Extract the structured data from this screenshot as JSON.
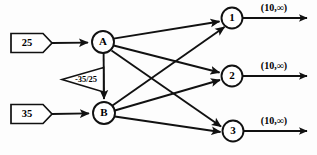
{
  "diagram": {
    "type": "network-flow-graph",
    "title": "",
    "canvas": {
      "width": 317,
      "height": 155
    },
    "supply_nodes": [
      {
        "id": "supply-25",
        "label": "25",
        "shape": "pentagon-right",
        "x": 30,
        "y": 43
      },
      {
        "id": "supply-35",
        "label": "35",
        "shape": "pentagon-right",
        "x": 30,
        "y": 114
      }
    ],
    "transshipment_nodes": [
      {
        "id": "node-a",
        "label": "A",
        "shape": "circle",
        "x": 103,
        "y": 42,
        "r": 11
      },
      {
        "id": "node-b",
        "label": "B",
        "shape": "circle",
        "x": 104,
        "y": 113,
        "r": 11
      }
    ],
    "demand_nodes": [
      {
        "id": "node-1",
        "label": "1",
        "shape": "circle",
        "x": 232,
        "y": 18,
        "r": 10.5
      },
      {
        "id": "node-2",
        "label": "2",
        "shape": "circle",
        "x": 232,
        "y": 76,
        "r": 10.5
      },
      {
        "id": "node-3",
        "label": "3",
        "shape": "circle",
        "x": 233,
        "y": 131,
        "r": 10.5
      }
    ],
    "edges": [
      {
        "id": "edge-supply25-a",
        "from": "supply-25",
        "to": "node-a",
        "label": ""
      },
      {
        "id": "edge-supply35-b",
        "from": "supply-35",
        "to": "node-b",
        "label": ""
      },
      {
        "id": "edge-a-b",
        "from": "node-a",
        "to": "node-b",
        "label": "-35/25"
      },
      {
        "id": "edge-a-1",
        "from": "node-a",
        "to": "node-1",
        "label": ""
      },
      {
        "id": "edge-a-2",
        "from": "node-a",
        "to": "node-2",
        "label": ""
      },
      {
        "id": "edge-a-3",
        "from": "node-a",
        "to": "node-3",
        "label": ""
      },
      {
        "id": "edge-b-1",
        "from": "node-b",
        "to": "node-1",
        "label": ""
      },
      {
        "id": "edge-b-2",
        "from": "node-b",
        "to": "node-2",
        "label": ""
      },
      {
        "id": "edge-b-3",
        "from": "node-b",
        "to": "node-3",
        "label": ""
      }
    ],
    "output_arcs": [
      {
        "id": "output-1",
        "from": "node-1",
        "label": "(10,∞)",
        "label_x": 274,
        "label_y": 9
      },
      {
        "id": "output-2",
        "from": "node-2",
        "label": "(10,∞)",
        "label_x": 274,
        "label_y": 67
      },
      {
        "id": "output-3",
        "from": "node-3",
        "label": "(10,∞)",
        "label_x": 274,
        "label_y": 122
      }
    ],
    "flag_annotation": {
      "id": "flag-a-b",
      "label": "-35/25",
      "shape": "triangle-left",
      "x": 87,
      "y": 79
    },
    "colors": {
      "stroke": "#111111",
      "fill": "#ffffff",
      "background": "#fdfdfd",
      "text": "#000000"
    }
  }
}
